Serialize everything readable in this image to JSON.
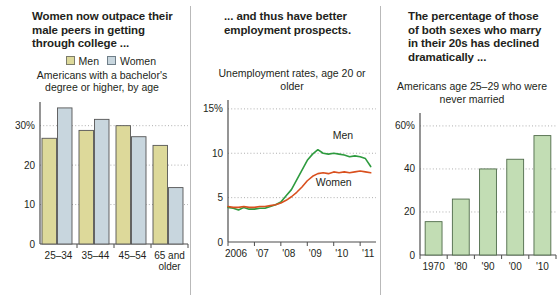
{
  "panels": [
    {
      "headline": "Women now outpace their male peers in getting through college ...",
      "subtitle": "Americans with a bachelor's degree or higher, by age",
      "legend": [
        {
          "label": "Men",
          "color": "#ddd99a"
        },
        {
          "label": "Women",
          "color": "#c8d6de"
        }
      ]
    },
    {
      "headline": "... and thus have better employment prospects.",
      "subtitle": "Unemployment rates, age 20 or older"
    },
    {
      "headline": "The percentage of those of both sexes who marry in their 20s has declined dramatically ...",
      "subtitle": "Americans age 25–29 who were never married"
    }
  ],
  "chart_data": [
    {
      "type": "bar",
      "title": "Americans with a bachelor's degree or higher, by age",
      "categories": [
        "25–34",
        "35–44",
        "45–54",
        "65 and older"
      ],
      "series": [
        {
          "name": "Men",
          "color": "#ddd99a",
          "values": [
            26.8,
            28.8,
            30.0,
            25.0
          ]
        },
        {
          "name": "Women",
          "color": "#c8d6de",
          "values": [
            34.5,
            31.6,
            27.2,
            14.3
          ]
        }
      ],
      "xlabel": "",
      "ylabel": "",
      "ylim": [
        0,
        36
      ],
      "yticks": [
        0,
        10,
        20,
        30
      ],
      "yticklabels": [
        "0",
        "10",
        "20",
        "30%"
      ],
      "grid": true,
      "legend_position": "top-right"
    },
    {
      "type": "line",
      "title": "Unemployment rates, age 20 or older",
      "xlabel": "",
      "ylabel": "",
      "xlim": [
        2006,
        2011.6
      ],
      "ylim": [
        0,
        16
      ],
      "yticks": [
        0,
        5,
        10,
        15
      ],
      "yticklabels": [
        "0",
        "5",
        "10",
        "15%"
      ],
      "xticks": [
        2006,
        2007,
        2008,
        2009,
        2010,
        2011
      ],
      "xticklabels": [
        "2006",
        "'07",
        "'08",
        "'09",
        "'10",
        "'11"
      ],
      "grid": true,
      "annotations": [
        {
          "text": "Men",
          "x": 2010.35,
          "y": 11.6
        },
        {
          "text": "Women",
          "x": 2010.0,
          "y": 6.3
        }
      ],
      "series": [
        {
          "name": "Men",
          "color": "#2e9b3f",
          "x": [
            2006.0,
            2006.2,
            2006.4,
            2006.6,
            2006.8,
            2007.0,
            2007.2,
            2007.4,
            2007.6,
            2007.8,
            2008.0,
            2008.2,
            2008.4,
            2008.6,
            2008.8,
            2009.0,
            2009.2,
            2009.4,
            2009.6,
            2009.8,
            2010.0,
            2010.2,
            2010.4,
            2010.6,
            2010.8,
            2011.0,
            2011.2,
            2011.4
          ],
          "values": [
            3.9,
            3.8,
            3.6,
            3.9,
            3.7,
            3.7,
            3.8,
            3.8,
            4.0,
            4.2,
            4.5,
            5.2,
            5.9,
            7.0,
            8.1,
            9.2,
            9.9,
            10.4,
            10.0,
            9.9,
            10.0,
            9.9,
            9.8,
            9.6,
            9.7,
            9.6,
            9.4,
            8.5
          ]
        },
        {
          "name": "Women",
          "color": "#d9501e",
          "x": [
            2006.0,
            2006.2,
            2006.4,
            2006.6,
            2006.8,
            2007.0,
            2007.2,
            2007.4,
            2007.6,
            2007.8,
            2008.0,
            2008.2,
            2008.4,
            2008.6,
            2008.8,
            2009.0,
            2009.2,
            2009.4,
            2009.6,
            2009.8,
            2010.0,
            2010.2,
            2010.4,
            2010.6,
            2010.8,
            2011.0,
            2011.2,
            2011.4
          ],
          "values": [
            4.0,
            3.9,
            3.9,
            4.0,
            3.9,
            3.9,
            4.0,
            4.0,
            4.1,
            4.2,
            4.4,
            4.7,
            5.1,
            5.6,
            6.2,
            6.9,
            7.4,
            7.7,
            7.8,
            7.7,
            7.9,
            7.8,
            7.9,
            7.8,
            7.9,
            8.0,
            7.9,
            7.8
          ]
        }
      ]
    },
    {
      "type": "bar",
      "title": "Americans age 25–29 who were never married",
      "categories": [
        "1970",
        "'80",
        "'90",
        "'00",
        "'10"
      ],
      "values": [
        15.5,
        26.0,
        40.0,
        44.5,
        55.5
      ],
      "color": "#c2ddb4",
      "xlabel": "",
      "ylabel": "",
      "ylim": [
        0,
        66
      ],
      "yticks": [
        0,
        20,
        40,
        60
      ],
      "yticklabels": [
        "0",
        "20",
        "40",
        "60%"
      ],
      "grid": true
    }
  ]
}
